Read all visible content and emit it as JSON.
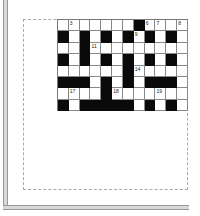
{
  "crossword": {
    "rows": 8,
    "cols": 12,
    "pattern": [
      "WWWWWWWBWWWW",
      "BWBWBWBWBWBW",
      "WWBWWWWWWWWW",
      "BWBWBWBWBWBW",
      "WWWWWWBWWWWW",
      "BBBWBWBWBBBW",
      "WWWWBWWWWWWW",
      "BWBBBBBWBWBW"
    ],
    "numbers": [
      {
        "row": 0,
        "col": 1,
        "n": "3"
      },
      {
        "row": 0,
        "col": 8,
        "n": "6"
      },
      {
        "row": 0,
        "col": 9,
        "n": "7"
      },
      {
        "row": 0,
        "col": 11,
        "n": "8"
      },
      {
        "row": 1,
        "col": 7,
        "n": "9"
      },
      {
        "row": 2,
        "col": 3,
        "n": "11"
      },
      {
        "row": 4,
        "col": 7,
        "n": "14"
      },
      {
        "row": 6,
        "col": 1,
        "n": "17"
      },
      {
        "row": 6,
        "col": 5,
        "n": "18"
      },
      {
        "row": 6,
        "col": 9,
        "n": "19"
      }
    ]
  }
}
